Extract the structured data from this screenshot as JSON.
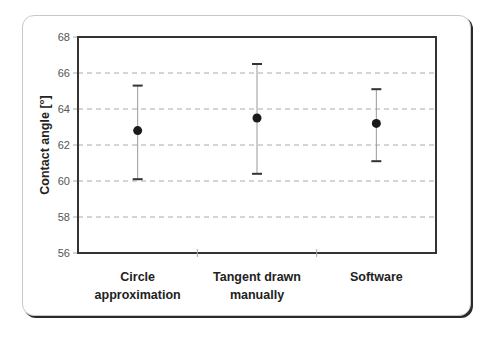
{
  "chart_data": {
    "type": "scatter",
    "subtype": "dot-with-error-bars",
    "title": "",
    "xlabel": "",
    "ylabel": "Contact angle [°]",
    "ylim": [
      56,
      68
    ],
    "yticks": [
      56,
      58,
      60,
      62,
      64,
      66,
      68
    ],
    "grid": {
      "horizontal": true,
      "style": "dashed",
      "vertical": false
    },
    "legend": null,
    "categories": [
      [
        "Circle",
        "approximation"
      ],
      [
        "Tangent drawn",
        "manually"
      ],
      [
        "Software"
      ]
    ],
    "series": [
      {
        "name": "Contact angle",
        "values": [
          62.8,
          63.5,
          63.2
        ],
        "error_upper": [
          65.3,
          66.5,
          65.1
        ],
        "error_lower": [
          60.1,
          60.4,
          61.1
        ]
      }
    ]
  },
  "colors": {
    "marker": "#1a1a1a",
    "error_bar": "#999999",
    "error_cap": "#333333",
    "grid": "#aaaaaa",
    "axis": "#333333"
  }
}
